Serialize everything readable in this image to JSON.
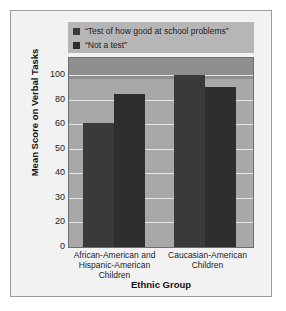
{
  "chart_data": {
    "type": "bar",
    "title": "",
    "xlabel": "Ethnic Group",
    "ylabel": "Mean Score on Verbal Tasks",
    "categories": [
      "African-American and Hispanic-American Children",
      "Caucasian-American Children"
    ],
    "series": [
      {
        "name": "“Test of how good at school problems”",
        "color": "#3a3a3a",
        "values": [
          61,
          100
        ]
      },
      {
        "name": "“Not a test”",
        "color": "#2e2e2e",
        "values": [
          85,
          90
        ]
      }
    ],
    "ytick_labels": [
      "0",
      "20",
      "30",
      "40",
      "50",
      "60",
      "80",
      "100"
    ],
    "ylim": [
      0,
      110
    ],
    "grid": true,
    "legend_position": "top",
    "plot_background": "#a8a8a8",
    "figure_background": "#f2f2f2",
    "gridline_color": "#e6e6e6"
  },
  "legend": {
    "items": [
      {
        "label": "“Test of how good at school problems”"
      },
      {
        "label": "“Not a test”"
      }
    ]
  },
  "axes": {
    "y_title": "Mean Score on Verbal Tasks",
    "x_title": "Ethnic Group",
    "ticks": [
      "100",
      "80",
      "60",
      "50",
      "40",
      "30",
      "20",
      "0"
    ],
    "categories": [
      {
        "line1": "African-American and",
        "line2": "Hispanic-American",
        "line3": "Children"
      },
      {
        "line1": "Caucasian-American",
        "line2": "Children",
        "line3": ""
      }
    ]
  }
}
